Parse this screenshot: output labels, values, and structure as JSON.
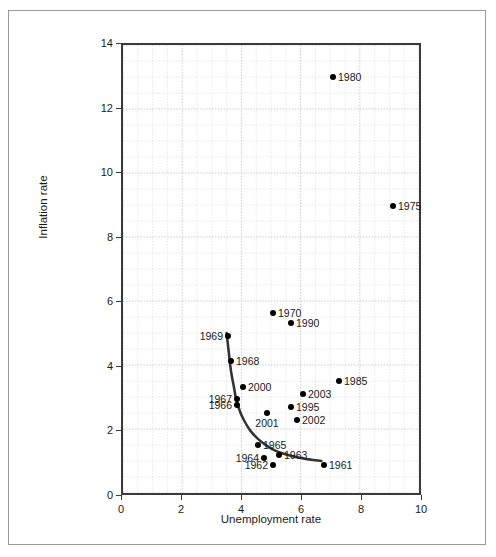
{
  "chart_data": {
    "type": "scatter",
    "title": "",
    "xlabel": "Unemployment rate",
    "ylabel": "Inflation rate",
    "xlim": [
      0,
      10
    ],
    "ylim": [
      0,
      14
    ],
    "xticks": [
      0,
      2,
      4,
      6,
      8,
      10
    ],
    "yticks": [
      0,
      2,
      4,
      6,
      8,
      10,
      12,
      14
    ],
    "xtick_labels": [
      "0",
      "2",
      "4",
      "6",
      "8",
      "10"
    ],
    "ytick_labels": [
      "0",
      "2",
      "4",
      "6",
      "8",
      "10",
      "12",
      "14"
    ],
    "grid": true,
    "grid_minor_step": 0.5,
    "legend": "none",
    "point_color": "#000000",
    "curve_color": "#333333",
    "points": [
      {
        "label": "1980",
        "x": 7.0,
        "y": 13.0,
        "label_pos": "right"
      },
      {
        "label": "1975",
        "x": 9.0,
        "y": 9.0,
        "label_pos": "right"
      },
      {
        "label": "1970",
        "x": 5.0,
        "y": 5.7,
        "label_pos": "right"
      },
      {
        "label": "1990",
        "x": 5.6,
        "y": 5.4,
        "label_pos": "right"
      },
      {
        "label": "1969",
        "x": 3.5,
        "y": 5.0,
        "label_pos": "left"
      },
      {
        "label": "1968",
        "x": 3.6,
        "y": 4.2,
        "label_pos": "right"
      },
      {
        "label": "1985",
        "x": 7.2,
        "y": 3.6,
        "label_pos": "right"
      },
      {
        "label": "2000",
        "x": 4.0,
        "y": 3.4,
        "label_pos": "right"
      },
      {
        "label": "2003",
        "x": 6.0,
        "y": 3.2,
        "label_pos": "right"
      },
      {
        "label": "1967",
        "x": 3.8,
        "y": 3.05,
        "label_pos": "left"
      },
      {
        "label": "1966",
        "x": 3.8,
        "y": 2.85,
        "label_pos": "left"
      },
      {
        "label": "1995",
        "x": 5.6,
        "y": 2.8,
        "label_pos": "right"
      },
      {
        "label": "2001",
        "x": 4.8,
        "y": 2.6,
        "label_pos": "below"
      },
      {
        "label": "2002",
        "x": 5.8,
        "y": 2.4,
        "label_pos": "right"
      },
      {
        "label": "1965",
        "x": 4.5,
        "y": 1.6,
        "label_pos": "right"
      },
      {
        "label": "1963",
        "x": 5.2,
        "y": 1.3,
        "label_pos": "right"
      },
      {
        "label": "1964",
        "x": 4.7,
        "y": 1.2,
        "label_pos": "left"
      },
      {
        "label": "1962",
        "x": 5.0,
        "y": 1.0,
        "label_pos": "left"
      },
      {
        "label": "1961",
        "x": 6.7,
        "y": 1.0,
        "label_pos": "right"
      }
    ],
    "fitted_curve": {
      "name": "phillips-curve",
      "points": [
        {
          "x": 3.5,
          "y": 5.0
        },
        {
          "x": 3.58,
          "y": 4.35
        },
        {
          "x": 3.65,
          "y": 3.8
        },
        {
          "x": 3.75,
          "y": 3.3
        },
        {
          "x": 3.82,
          "y": 2.95
        },
        {
          "x": 3.95,
          "y": 2.55
        },
        {
          "x": 4.1,
          "y": 2.25
        },
        {
          "x": 4.3,
          "y": 1.95
        },
        {
          "x": 4.55,
          "y": 1.7
        },
        {
          "x": 4.85,
          "y": 1.48
        },
        {
          "x": 5.2,
          "y": 1.3
        },
        {
          "x": 5.6,
          "y": 1.18
        },
        {
          "x": 6.1,
          "y": 1.08
        },
        {
          "x": 6.7,
          "y": 1.0
        }
      ]
    }
  }
}
